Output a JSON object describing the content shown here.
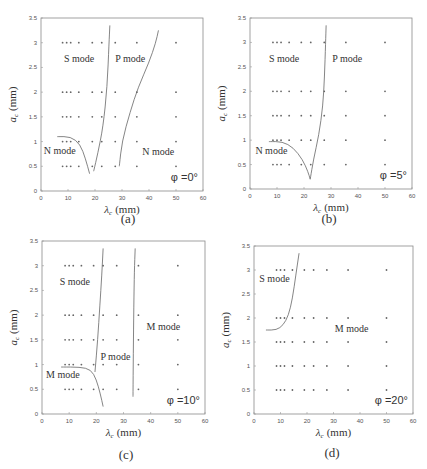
{
  "figure": {
    "panels": [
      {
        "id": "a",
        "caption": "(a)",
        "phi_label": "φ =0°"
      },
      {
        "id": "b",
        "caption": "(b)",
        "phi_label": "φ =5°"
      },
      {
        "id": "c",
        "caption": "(c)",
        "phi_label": "φ =10°"
      },
      {
        "id": "d",
        "caption": "(d)",
        "phi_label": "φ =20°"
      }
    ]
  },
  "chart_data": [
    {
      "type": "scatter",
      "title": "(a) φ = 0°",
      "xlabel": "λc (mm)",
      "ylabel": "ac (mm)",
      "xlim": [
        0,
        60
      ],
      "ylim": [
        0,
        3.5
      ],
      "xticks": [
        0,
        10,
        20,
        30,
        40,
        50,
        60
      ],
      "yticks": [
        0,
        0.5,
        1,
        1.5,
        2,
        2.5,
        3,
        3.5
      ],
      "grid": false,
      "sample_x": [
        8,
        9.5,
        11,
        14,
        19,
        22.5,
        27.5,
        35.5,
        50
      ],
      "sample_y": [
        0.5,
        1,
        1.5,
        2,
        3
      ],
      "annotation": "φ =0°",
      "regions": [
        {
          "label": "S mode",
          "x": 8.5,
          "y": 2.6
        },
        {
          "label": "P mode",
          "x": 27.5,
          "y": 2.6
        },
        {
          "label": "N mode",
          "x": 1,
          "y": 0.75
        },
        {
          "label": "N mode",
          "x": 37.5,
          "y": 0.72
        }
      ],
      "boundaries": [
        {
          "points": [
            [
              6,
              1.1
            ],
            [
              11,
              1.1
            ],
            [
              14.5,
              0.95
            ],
            [
              16.5,
              0.65
            ],
            [
              18,
              0.35
            ]
          ]
        },
        {
          "points": [
            [
              19.5,
              0.4
            ],
            [
              21,
              0.75
            ],
            [
              23,
              1.3
            ],
            [
              24.5,
              2.1
            ],
            [
              25.2,
              3.0
            ],
            [
              25.5,
              3.35
            ]
          ]
        },
        {
          "points": [
            [
              29,
              0.5
            ],
            [
              30,
              1.0
            ],
            [
              33,
              1.6
            ],
            [
              36,
              2.1
            ],
            [
              40,
              2.6
            ],
            [
              42.5,
              3.0
            ],
            [
              43.5,
              3.25
            ]
          ]
        }
      ]
    },
    {
      "type": "scatter",
      "title": "(b) φ = 5°",
      "xlabel": "λc (mm)",
      "ylabel": "ac (mm)",
      "xlim": [
        0,
        60
      ],
      "ylim": [
        0,
        3.5
      ],
      "xticks": [
        0,
        10,
        20,
        30,
        40,
        50,
        60
      ],
      "yticks": [
        0,
        0.5,
        1,
        1.5,
        2,
        2.5,
        3,
        3.5
      ],
      "grid": false,
      "sample_x": [
        8.5,
        10,
        11.5,
        14.5,
        19,
        22.5,
        27.5,
        35.5,
        50
      ],
      "sample_y": [
        0.5,
        1,
        1.5,
        2,
        3
      ],
      "annotation": "φ =5°",
      "regions": [
        {
          "label": "S mode",
          "x": 7,
          "y": 2.6
        },
        {
          "label": "P mode",
          "x": 30.5,
          "y": 2.6
        },
        {
          "label": "N mode",
          "x": 2,
          "y": 0.72
        }
      ],
      "boundaries": [
        {
          "points": [
            [
              7,
              0.97
            ],
            [
              12,
              0.97
            ],
            [
              16,
              0.85
            ],
            [
              19.5,
              0.6
            ],
            [
              21.5,
              0.35
            ],
            [
              22.3,
              0.2
            ]
          ]
        },
        {
          "points": [
            [
              22.3,
              0.2
            ],
            [
              23.5,
              0.6
            ],
            [
              25.5,
              1.1
            ],
            [
              27,
              1.7
            ],
            [
              27.6,
              2.3
            ],
            [
              28,
              3.0
            ],
            [
              28.2,
              3.35
            ]
          ]
        }
      ]
    },
    {
      "type": "scatter",
      "title": "(c) φ = 10°",
      "xlabel": "λc (mm)",
      "ylabel": "ac (mm)",
      "xlim": [
        0,
        60
      ],
      "ylim": [
        0,
        3.5
      ],
      "xticks": [
        0,
        10,
        20,
        30,
        40,
        50,
        60
      ],
      "yticks": [
        0,
        0.5,
        1,
        1.5,
        2,
        2.5,
        3,
        3.5
      ],
      "grid": false,
      "sample_x": [
        8.5,
        10,
        11.5,
        14.5,
        19,
        22.5,
        27.5,
        35.5,
        50
      ],
      "sample_y": [
        0.5,
        1,
        1.5,
        2,
        3
      ],
      "annotation": "φ =10°",
      "regions": [
        {
          "label": "S mode",
          "x": 6.5,
          "y": 2.6
        },
        {
          "label": "M mode",
          "x": 38.5,
          "y": 1.7
        },
        {
          "label": "P mode",
          "x": 21.5,
          "y": 1.1
        },
        {
          "label": "M mode",
          "x": 1.5,
          "y": 0.72
        }
      ],
      "boundaries": [
        {
          "points": [
            [
              7,
              0.95
            ],
            [
              14,
              0.95
            ],
            [
              18,
              0.9
            ],
            [
              20,
              0.7
            ],
            [
              21.5,
              0.4
            ],
            [
              22.5,
              0.15
            ]
          ]
        },
        {
          "points": [
            [
              19.5,
              0.85
            ],
            [
              20.5,
              1.5
            ],
            [
              21.3,
              2.2
            ],
            [
              22,
              2.8
            ],
            [
              22.5,
              3.35
            ]
          ]
        },
        {
          "points": [
            [
              33.5,
              0.35
            ],
            [
              33.6,
              1.2
            ],
            [
              33.8,
              2.2
            ],
            [
              34,
              2.9
            ],
            [
              34.3,
              3.35
            ]
          ]
        }
      ]
    },
    {
      "type": "scatter",
      "title": "(d) φ = 20°",
      "xlabel": "λc (mm)",
      "ylabel": "ac (mm)",
      "xlim": [
        0,
        60
      ],
      "ylim": [
        0,
        3.5
      ],
      "xticks": [
        0,
        10,
        20,
        30,
        40,
        50,
        60
      ],
      "yticks": [
        0,
        0.5,
        1,
        1.5,
        2,
        2.5,
        3,
        3.5
      ],
      "grid": false,
      "sample_x": [
        8.5,
        10,
        11.5,
        14.5,
        19,
        22.5,
        27.5,
        35.5,
        50
      ],
      "sample_y": [
        0.5,
        1,
        1.5,
        2,
        3
      ],
      "annotation": "φ =20°",
      "regions": [
        {
          "label": "S mode",
          "x": 2,
          "y": 2.75
        },
        {
          "label": "M mode",
          "x": 30.5,
          "y": 1.7
        }
      ],
      "boundaries": [
        {
          "points": [
            [
              4.5,
              1.75
            ],
            [
              8.5,
              1.75
            ],
            [
              11,
              1.85
            ],
            [
              13,
              2.05
            ],
            [
              14.5,
              2.4
            ],
            [
              15.8,
              2.9
            ],
            [
              17,
              3.35
            ]
          ]
        }
      ]
    }
  ]
}
